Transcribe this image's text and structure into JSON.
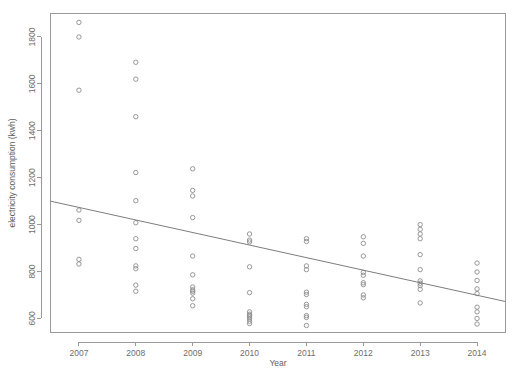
{
  "chart_data": {
    "type": "scatter",
    "title": "",
    "xlabel": "Year",
    "ylabel": "electricity consumption (kwh)",
    "xlim": [
      2006.5,
      2014.5
    ],
    "ylim": [
      540,
      1900
    ],
    "xticks": [
      2007,
      2008,
      2009,
      2010,
      2011,
      2012,
      2013,
      2014
    ],
    "xticklabels": [
      "2007",
      "2008",
      "2009",
      "2010",
      "2011",
      "2012",
      "2013",
      "2014"
    ],
    "yticks": [
      600,
      800,
      1000,
      1200,
      1400,
      1600,
      1800
    ],
    "yticklabels": [
      "600",
      "800",
      "1000",
      "1200",
      "1400",
      "1600",
      "1800"
    ],
    "grid": false,
    "legend": null,
    "marker": "open-circle",
    "marker_color": "#8c8c8c",
    "line_color": "#7d7d7d",
    "frame_color": "#9a9a9a",
    "series": [
      {
        "name": "electricity consumption",
        "points": [
          {
            "x": 2007,
            "y": 1862
          },
          {
            "x": 2007,
            "y": 1800
          },
          {
            "x": 2007,
            "y": 1573
          },
          {
            "x": 2007,
            "y": 1062
          },
          {
            "x": 2007,
            "y": 1018
          },
          {
            "x": 2007,
            "y": 852
          },
          {
            "x": 2007,
            "y": 832
          },
          {
            "x": 2008,
            "y": 1692
          },
          {
            "x": 2008,
            "y": 1620
          },
          {
            "x": 2008,
            "y": 1460
          },
          {
            "x": 2008,
            "y": 1222
          },
          {
            "x": 2008,
            "y": 1102
          },
          {
            "x": 2008,
            "y": 1008
          },
          {
            "x": 2008,
            "y": 940
          },
          {
            "x": 2008,
            "y": 898
          },
          {
            "x": 2008,
            "y": 824
          },
          {
            "x": 2008,
            "y": 812
          },
          {
            "x": 2008,
            "y": 742
          },
          {
            "x": 2008,
            "y": 716
          },
          {
            "x": 2009,
            "y": 1238
          },
          {
            "x": 2009,
            "y": 1146
          },
          {
            "x": 2009,
            "y": 1122
          },
          {
            "x": 2009,
            "y": 1030
          },
          {
            "x": 2009,
            "y": 866
          },
          {
            "x": 2009,
            "y": 786
          },
          {
            "x": 2009,
            "y": 734
          },
          {
            "x": 2009,
            "y": 722
          },
          {
            "x": 2009,
            "y": 716
          },
          {
            "x": 2009,
            "y": 708
          },
          {
            "x": 2009,
            "y": 684
          },
          {
            "x": 2009,
            "y": 654
          },
          {
            "x": 2010,
            "y": 960
          },
          {
            "x": 2010,
            "y": 934
          },
          {
            "x": 2010,
            "y": 926
          },
          {
            "x": 2010,
            "y": 820
          },
          {
            "x": 2010,
            "y": 710
          },
          {
            "x": 2010,
            "y": 628
          },
          {
            "x": 2010,
            "y": 618
          },
          {
            "x": 2010,
            "y": 612
          },
          {
            "x": 2010,
            "y": 606
          },
          {
            "x": 2010,
            "y": 598
          },
          {
            "x": 2010,
            "y": 588
          },
          {
            "x": 2010,
            "y": 578
          },
          {
            "x": 2011,
            "y": 940
          },
          {
            "x": 2011,
            "y": 928
          },
          {
            "x": 2011,
            "y": 824
          },
          {
            "x": 2011,
            "y": 808
          },
          {
            "x": 2011,
            "y": 712
          },
          {
            "x": 2011,
            "y": 702
          },
          {
            "x": 2011,
            "y": 660
          },
          {
            "x": 2011,
            "y": 650
          },
          {
            "x": 2011,
            "y": 612
          },
          {
            "x": 2011,
            "y": 604
          },
          {
            "x": 2011,
            "y": 570
          },
          {
            "x": 2012,
            "y": 948
          },
          {
            "x": 2012,
            "y": 920
          },
          {
            "x": 2012,
            "y": 866
          },
          {
            "x": 2012,
            "y": 796
          },
          {
            "x": 2012,
            "y": 784
          },
          {
            "x": 2012,
            "y": 752
          },
          {
            "x": 2012,
            "y": 744
          },
          {
            "x": 2012,
            "y": 700
          },
          {
            "x": 2012,
            "y": 688
          },
          {
            "x": 2013,
            "y": 1000
          },
          {
            "x": 2013,
            "y": 980
          },
          {
            "x": 2013,
            "y": 960
          },
          {
            "x": 2013,
            "y": 940
          },
          {
            "x": 2013,
            "y": 872
          },
          {
            "x": 2013,
            "y": 808
          },
          {
            "x": 2013,
            "y": 760
          },
          {
            "x": 2013,
            "y": 750
          },
          {
            "x": 2013,
            "y": 740
          },
          {
            "x": 2013,
            "y": 724
          },
          {
            "x": 2013,
            "y": 666
          },
          {
            "x": 2014,
            "y": 836
          },
          {
            "x": 2014,
            "y": 798
          },
          {
            "x": 2014,
            "y": 762
          },
          {
            "x": 2014,
            "y": 726
          },
          {
            "x": 2014,
            "y": 706
          },
          {
            "x": 2014,
            "y": 648
          },
          {
            "x": 2014,
            "y": 628
          },
          {
            "x": 2014,
            "y": 600
          },
          {
            "x": 2014,
            "y": 576
          }
        ]
      }
    ],
    "trend_line": {
      "name": "linear fit",
      "x1": 2006.5,
      "y1": 1100,
      "x2": 2014.5,
      "y2": 672
    }
  }
}
